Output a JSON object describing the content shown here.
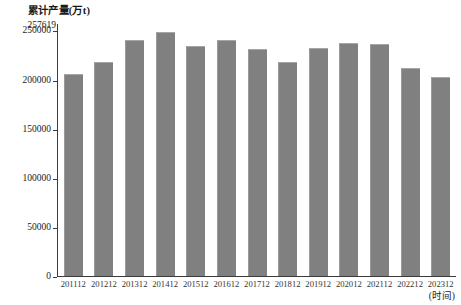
{
  "chart_data": {
    "type": "bar",
    "title": "",
    "ylabel": "累计产量(万t)",
    "xlabel": "(时间)",
    "categories": [
      "201112",
      "201212",
      "201312",
      "201412",
      "201512",
      "201612",
      "201712",
      "201812",
      "201912",
      "202012",
      "202112",
      "202212",
      "202312"
    ],
    "values": [
      206000,
      218000,
      240500,
      248000,
      234000,
      240000,
      231000,
      217500,
      232000,
      237500,
      236000,
      212000,
      203000
    ],
    "ylim": [
      0,
      257619
    ],
    "yticks": [
      0,
      50000,
      100000,
      150000,
      200000,
      250000
    ],
    "ytick_labels": [
      "0",
      "50000",
      "100000",
      "150000",
      "200000",
      "250000"
    ],
    "y_max_annotation": "257619",
    "grid": false,
    "legend": "none",
    "bar_color": "#808080",
    "axis_color": "#3b3b3b"
  }
}
